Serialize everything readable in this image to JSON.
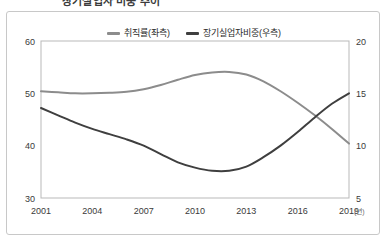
{
  "header": {
    "title_cropped": "장기실업자 비중 추이",
    "title_right_cropped": ""
  },
  "legend": {
    "position": "top-center",
    "items": [
      {
        "label": "취직률(좌측)",
        "color": "#8c8c8c",
        "axis": "left"
      },
      {
        "label": "장기실업자비중(우측)",
        "color": "#3f3f3f",
        "axis": "right"
      }
    ]
  },
  "axes": {
    "left": {
      "ticks": [
        "30",
        "40",
        "50",
        "60"
      ],
      "min": 30,
      "max": 60
    },
    "right": {
      "ticks": [
        "5",
        "10",
        "15",
        "20"
      ],
      "min": 5,
      "max": 20
    },
    "x": {
      "ticks": [
        "2001",
        "2004",
        "2007",
        "2010",
        "2013",
        "2016",
        "2019"
      ],
      "unit": "(년)",
      "min": 2001,
      "max": 2019
    }
  },
  "chart_data": {
    "type": "line",
    "title": "장기실업자 비중 추이",
    "xlabel": "(년)",
    "ylabel": "",
    "grid": false,
    "legend_position": "top-center",
    "x": [
      2001,
      2002,
      2003,
      2004,
      2005,
      2006,
      2007,
      2008,
      2009,
      2010,
      2011,
      2012,
      2013,
      2014,
      2015,
      2016,
      2017,
      2018,
      2019
    ],
    "series": [
      {
        "name": "취직률(좌측)",
        "axis": "left",
        "color": "#8c8c8c",
        "ylim": [
          30,
          60
        ],
        "values": [
          50.4,
          50.2,
          50.0,
          50.0,
          50.1,
          50.3,
          50.8,
          51.6,
          52.6,
          53.5,
          54.0,
          54.1,
          53.6,
          52.3,
          50.4,
          48.2,
          45.8,
          43.2,
          40.4
        ]
      },
      {
        "name": "장기실업자비중(우측)",
        "axis": "right",
        "color": "#3f3f3f",
        "ylim": [
          5,
          20
        ],
        "values": [
          13.6,
          12.9,
          12.2,
          11.6,
          11.1,
          10.6,
          10.0,
          9.2,
          8.4,
          7.9,
          7.6,
          7.6,
          8.0,
          8.9,
          10.0,
          11.3,
          12.7,
          14.0,
          15.0
        ]
      }
    ]
  }
}
